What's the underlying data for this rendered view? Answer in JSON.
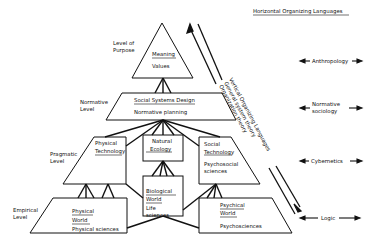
{
  "header": {
    "title": "Horizontal Organizing Languages"
  },
  "levels": {
    "purpose": [
      "Level of",
      "Purpose"
    ],
    "normative": [
      "Normative",
      "Level"
    ],
    "pragmatic": [
      "Pragmatic",
      "Level"
    ],
    "empirical": [
      "Empirical",
      "Level"
    ]
  },
  "boxes": {
    "meaning": {
      "title": "Meaning",
      "sub": "Values"
    },
    "social_systems": {
      "title": "Social Systems Design",
      "sub": "Normative planning"
    },
    "physical_technology": {
      "title1": "Physical",
      "title2": "Technology"
    },
    "natural_ecology": {
      "title1": "Natural",
      "title2": "Ecology"
    },
    "social_technology": {
      "title1": "Social",
      "title2": "Technology",
      "sub1": "Psychosocial",
      "sub2": "sciences"
    },
    "biological_world": {
      "title1": "Biological",
      "title2": "World",
      "sub1": "Life",
      "sub2": "sciences"
    },
    "physical_world": {
      "title1": "Physical",
      "title2": "World",
      "sub": "Physical sciences"
    },
    "psychical_world": {
      "title1": "Psychical",
      "title2": "World",
      "sub": "Psychosciences"
    }
  },
  "vertical_languages": {
    "title": "Vertical Organizing Languages",
    "line1": "General system theory",
    "line2": "Organization theory"
  },
  "horizontal_languages": [
    "Anthropology",
    "Normative sociology",
    "Cybernetics",
    "Logic"
  ],
  "horizontal_languages_split": {
    "normative1": "Normative",
    "normative2": "sociology"
  }
}
